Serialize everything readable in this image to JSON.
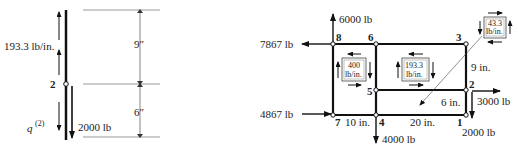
{
  "left_figure": {
    "shear_flow_label": "193.3 lb/in.",
    "node_label": "2",
    "force_label": "2000 lb",
    "q_label": "q",
    "q_superscript": "(2)",
    "dim_top": "9″",
    "dim_bottom": "6″"
  },
  "right_figure": {
    "nodes": [
      "1",
      "2",
      "3",
      "4",
      "5",
      "6",
      "7",
      "8"
    ],
    "forces": {
      "f6000": "6000 lb",
      "f7867": "7867 lb",
      "f4867": "4867 lb",
      "f4000": "4000 lb",
      "f3000": "3000 lb",
      "f2000": "2000 lb"
    },
    "panels": {
      "p400": [
        "400",
        "lb/in."
      ],
      "p193": [
        "193.3",
        "lb/in."
      ],
      "p43": [
        "43.3",
        "lb/in."
      ]
    },
    "dims": {
      "d9": "9 in.",
      "d6": "6 in.",
      "d10": "10 in.",
      "d20": "20 in."
    }
  }
}
